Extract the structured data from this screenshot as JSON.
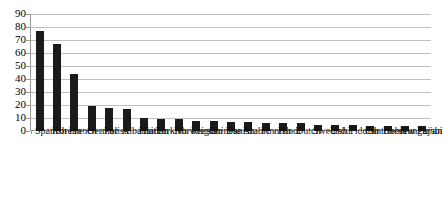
{
  "chart_data": {
    "type": "bar",
    "title": "",
    "subtitle": "",
    "xlabel": "",
    "ylabel": "",
    "ylim": [
      0,
      90
    ],
    "ytick_step": 10,
    "yticks": [
      90,
      80,
      70,
      60,
      50,
      40,
      30,
      20,
      10,
      0
    ],
    "grid": true,
    "legend": null,
    "legend_position": "none",
    "bar_color": "#1a1a1a",
    "gridline_color": "#bfbfbf",
    "axis_color": "#9a9a9a",
    "xtick_label_rotation": -90,
    "categories": [
      "Spanish",
      "Korean",
      "French",
      "German",
      "Polish",
      "Albanian",
      "Haitian",
      "Turkish",
      "Norweigia",
      "Russian",
      "Chinese",
      "Danish",
      "Arabic",
      "Finnish",
      "Hindi",
      "Dutch",
      "Swedish",
      "Urdu",
      "Yiddish",
      "Cantonese",
      "Hebrew",
      "Hungarian",
      "Pujabi"
    ],
    "values": [
      77,
      67,
      44,
      19,
      18,
      17,
      10,
      9,
      9,
      8,
      8,
      7,
      7,
      6,
      6,
      6,
      5,
      5,
      5,
      4,
      4,
      4,
      4
    ]
  }
}
